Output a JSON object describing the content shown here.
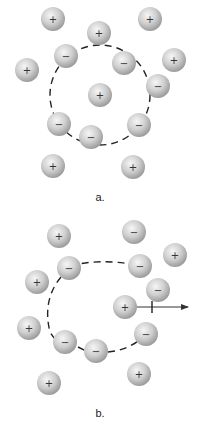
{
  "colors": {
    "ball": "#c8c8c8",
    "ball_highlight": "#f4f4f4",
    "ball_edge": "#9a9a9a",
    "dash": "#222222",
    "arrow": "#333333"
  },
  "panels": [
    {
      "label": "a.",
      "label_pos": [
        100,
        201
      ],
      "boundary": {
        "type": "circle",
        "cx": 100,
        "cy": 95,
        "r": 50
      },
      "ions": [
        {
          "charge": "+",
          "x": 53,
          "y": 19
        },
        {
          "charge": "+",
          "x": 150,
          "y": 19
        },
        {
          "charge": "+",
          "x": 99,
          "y": 33
        },
        {
          "charge": "−",
          "x": 66,
          "y": 56
        },
        {
          "charge": "−",
          "x": 124,
          "y": 63
        },
        {
          "charge": "+",
          "x": 27,
          "y": 70
        },
        {
          "charge": "+",
          "x": 174,
          "y": 60
        },
        {
          "charge": "−",
          "x": 158,
          "y": 86
        },
        {
          "charge": "+",
          "x": 100,
          "y": 95
        },
        {
          "charge": "−",
          "x": 59,
          "y": 124
        },
        {
          "charge": "−",
          "x": 91,
          "y": 137
        },
        {
          "charge": "−",
          "x": 139,
          "y": 125
        },
        {
          "charge": "+",
          "x": 53,
          "y": 166
        },
        {
          "charge": "+",
          "x": 133,
          "y": 167
        }
      ]
    },
    {
      "label": "b.",
      "label_pos": [
        100,
        417
      ],
      "boundary": {
        "type": "broken-ring"
      },
      "ions": [
        {
          "charge": "+",
          "x": 59,
          "y": 236
        },
        {
          "charge": "−",
          "x": 134,
          "y": 232
        },
        {
          "charge": "+",
          "x": 175,
          "y": 255
        },
        {
          "charge": "−",
          "x": 69,
          "y": 268
        },
        {
          "charge": "−",
          "x": 140,
          "y": 266
        },
        {
          "charge": "+",
          "x": 37,
          "y": 282
        },
        {
          "charge": "−",
          "x": 158,
          "y": 290
        },
        {
          "charge": "+",
          "x": 125,
          "y": 307
        },
        {
          "charge": "+",
          "x": 29,
          "y": 328
        },
        {
          "charge": "−",
          "x": 146,
          "y": 334
        },
        {
          "charge": "−",
          "x": 65,
          "y": 342
        },
        {
          "charge": "−",
          "x": 96,
          "y": 351
        },
        {
          "charge": "+",
          "x": 139,
          "y": 374
        },
        {
          "charge": "+",
          "x": 49,
          "y": 383
        }
      ],
      "arrow": {
        "x1": 137,
        "y1": 307,
        "x2": 190,
        "y2": 307,
        "tick_x": 152
      }
    }
  ]
}
